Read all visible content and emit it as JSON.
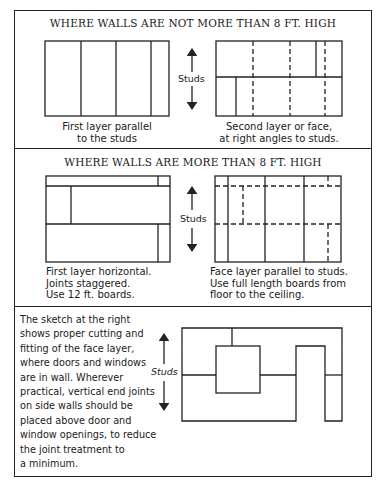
{
  "sections": [
    {
      "title": "WHERE WALLS ARE NOT MORE THAN 8 FT. HIGH",
      "left_caption": [
        "First layer parallel",
        "to the studs"
      ],
      "right_caption": [
        "Second layer or face,",
        "at right angles to studs."
      ],
      "arrow_label": "Studs"
    },
    {
      "title": "WHERE WALLS ARE MORE THAN 8 FT. HIGH",
      "left_caption": [
        "First layer horizontal.",
        "Joints staggered.",
        "Use 12 ft. boards."
      ],
      "right_caption": [
        "Face layer parallel to studs.",
        "Use full length boards from",
        "floor to the ceiling."
      ],
      "arrow_label": "Studs"
    },
    {
      "description": [
        "The sketch at the right",
        "shows proper cutting and",
        "fitting of the face layer,",
        "where doors and windows",
        "are in wall. Wherever",
        "practical, vertical end joints",
        "on side walls should be",
        "placed above door and",
        "window openings, to reduce",
        "the joint treatment to",
        "a minimum."
      ],
      "arrow_label": "Studs"
    }
  ],
  "colors": {
    "line": "#222222",
    "background": "#ffffff"
  }
}
